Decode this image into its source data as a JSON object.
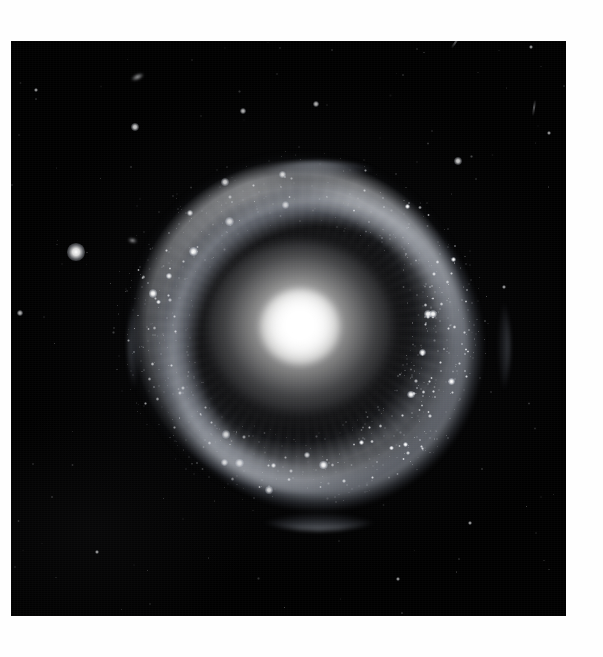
{
  "page": {
    "background_color": "#fefefe",
    "width": 603,
    "height": 657
  },
  "plate": {
    "label": "Hoag's Object",
    "subject_type": "ring galaxy",
    "background_color": "#000000",
    "left": 11,
    "top": 41,
    "width": 555,
    "height": 575
  },
  "galaxy": {
    "core": {
      "label": "central elliptical nucleus",
      "center_x": 300,
      "center_y": 327,
      "bright_radius": 40,
      "halo_radius": 150,
      "color": "#ffffff"
    },
    "gap": {
      "label": "dark gap",
      "inner_radius": 48,
      "outer_radius": 118
    },
    "ring": {
      "label": "star-forming ring",
      "inner_radius": 120,
      "outer_radius": 172,
      "color": "#bcc4d4",
      "brightest_sector": "east",
      "knot_count": 64
    }
  },
  "field_objects": [
    {
      "name": "background-galaxy",
      "x": 137,
      "y": 77,
      "w": 13,
      "h": 6,
      "rot": -24
    },
    {
      "name": "background-galaxy",
      "x": 132,
      "y": 240,
      "w": 9,
      "h": 5,
      "rot": 12
    },
    {
      "name": "foreground-star",
      "x": 76,
      "y": 252,
      "size": 8
    },
    {
      "name": "foreground-star",
      "x": 135,
      "y": 127,
      "size": 4
    },
    {
      "name": "foreground-star",
      "x": 458,
      "y": 161,
      "size": 4
    },
    {
      "name": "foreground-star",
      "x": 243,
      "y": 111,
      "size": 3
    },
    {
      "name": "foreground-star",
      "x": 316,
      "y": 104,
      "size": 3
    },
    {
      "name": "foreground-star",
      "x": 20,
      "y": 313,
      "size": 3
    },
    {
      "name": "foreground-star",
      "x": 504,
      "y": 287,
      "size": 2
    },
    {
      "name": "foreground-star",
      "x": 36,
      "y": 90,
      "size": 2
    },
    {
      "name": "foreground-star",
      "x": 531,
      "y": 47,
      "size": 2
    },
    {
      "name": "foreground-star",
      "x": 549,
      "y": 133,
      "size": 2
    },
    {
      "name": "foreground-star",
      "x": 398,
      "y": 579,
      "size": 2
    },
    {
      "name": "foreground-star",
      "x": 97,
      "y": 552,
      "size": 2
    },
    {
      "name": "foreground-star",
      "x": 470,
      "y": 523,
      "size": 2
    },
    {
      "name": "cosmic-ray-streak",
      "x": 534,
      "y": 108,
      "w": 2,
      "h": 16,
      "rot": 8
    },
    {
      "name": "cosmic-ray-streak",
      "x": 455,
      "y": 43,
      "w": 2,
      "h": 12,
      "rot": 35
    }
  ],
  "chart_data": {
    "type": "heatmap",
    "center": [
      300,
      327
    ],
    "radial_profile": {
      "radius_px": [
        0,
        10,
        20,
        30,
        40,
        55,
        70,
        85,
        100,
        115,
        130,
        145,
        160,
        175,
        190,
        210
      ],
      "mean_brightness": [
        255,
        252,
        228,
        178,
        126,
        62,
        30,
        16,
        10,
        12,
        26,
        44,
        48,
        30,
        10,
        4
      ],
      "note": "0-255 grayscale; peak at nucleus, minimum in gap near r=100, secondary peak of ring near r=150"
    },
    "azimuthal_ring_brightness": {
      "angle_deg": [
        0,
        30,
        60,
        90,
        120,
        150,
        180,
        210,
        240,
        270,
        300,
        330
      ],
      "values": [
        62,
        58,
        40,
        26,
        30,
        42,
        46,
        38,
        28,
        36,
        54,
        66
      ],
      "note": "angle measured counter-clockwise from east; ring brightest on east/north-east limb"
    },
    "grid": false,
    "legend": false
  }
}
